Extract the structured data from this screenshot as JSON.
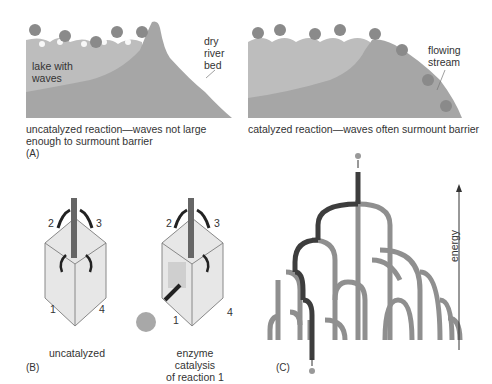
{
  "panel_a": {
    "letter": "(A)",
    "left": {
      "lake_label": [
        "lake with",
        "waves"
      ],
      "river_label": [
        "dry",
        "river",
        "bed"
      ],
      "caption": [
        "uncatalyzed reaction—waves not large",
        "enough to surmount barrier"
      ]
    },
    "right": {
      "stream_label": [
        "flowing",
        "stream"
      ],
      "caption": [
        "catalyzed reaction—waves often surmount barrier"
      ]
    }
  },
  "panel_b": {
    "letter": "(B)",
    "left": {
      "numbers": [
        "1",
        "2",
        "3",
        "4"
      ],
      "caption": [
        "uncatalyzed"
      ]
    },
    "right": {
      "numbers": [
        "1",
        "2",
        "3",
        "4"
      ],
      "caption": [
        "enzyme catalysis",
        "of reaction 1"
      ]
    }
  },
  "panel_c": {
    "letter": "(C)",
    "axis_label": "energy"
  },
  "colors": {
    "water": "#b9b9b9",
    "land": "#a3a3a3",
    "pipe_dark": "#3d3d3d",
    "pipe_light": "#8f8f8f",
    "box_frame": "#9a9a9a",
    "background": "#ffffff"
  }
}
